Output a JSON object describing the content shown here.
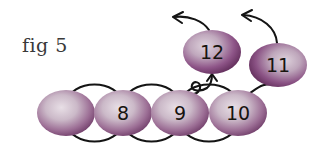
{
  "figure": {
    "caption": "fig 5",
    "caption_x": 22,
    "caption_y": 52,
    "background_color": "#ffffff",
    "width": 330,
    "height": 150
  },
  "palette": {
    "node_edge_dark": "#5f2a58",
    "node_mid": "#8e5f88",
    "node_light": "#d9ccd7",
    "node_highlight": "#e8dfe6",
    "stroke_black": "#141414",
    "caption_color": "#3a3a3a",
    "label_color": "#17140f"
  },
  "nodes": [
    {
      "id": "blank",
      "label": "",
      "cx": 66,
      "cy": 113,
      "rx": 29,
      "ry": 23,
      "row": "bottom"
    },
    {
      "id": "n8",
      "label": "8",
      "cx": 123,
      "cy": 113,
      "rx": 29,
      "ry": 23,
      "row": "bottom"
    },
    {
      "id": "n9",
      "label": "9",
      "cx": 180,
      "cy": 113,
      "rx": 29,
      "ry": 23,
      "row": "bottom"
    },
    {
      "id": "n10",
      "label": "10",
      "cx": 238,
      "cy": 113,
      "rx": 29,
      "ry": 23,
      "row": "bottom"
    },
    {
      "id": "n12",
      "label": "12",
      "cx": 212,
      "cy": 52,
      "rx": 29,
      "ry": 22,
      "row": "top"
    },
    {
      "id": "n11",
      "label": "11",
      "cx": 278,
      "cy": 65,
      "rx": 29,
      "ry": 22,
      "row": "top"
    }
  ],
  "edges": [
    {
      "id": "arc-blank-8-top",
      "from": "blank",
      "to": "n8",
      "style": "arc-above",
      "directed": false
    },
    {
      "id": "arc-blank-8-bot",
      "from": "blank",
      "to": "n8",
      "style": "arc-below",
      "directed": false
    },
    {
      "id": "arc-8-9-top",
      "from": "n8",
      "to": "n9",
      "style": "arc-above",
      "directed": false
    },
    {
      "id": "arc-8-9-bot",
      "from": "n8",
      "to": "n9",
      "style": "arc-below",
      "directed": false
    },
    {
      "id": "arc-9-10-top",
      "from": "n9",
      "to": "n10",
      "style": "arc-above",
      "directed": false
    },
    {
      "id": "arc-9-10-bot",
      "from": "n9",
      "to": "n10",
      "style": "arc-below",
      "directed": false
    },
    {
      "id": "curl-9-to-12",
      "from": "n9",
      "to": "n12",
      "style": "curl-loop",
      "directed": true
    },
    {
      "id": "arc-10-to-11",
      "from": "n10",
      "to": "n11",
      "style": "arc-right",
      "directed": false
    },
    {
      "id": "arrow-12-out",
      "from": "n12",
      "to": "",
      "style": "arrow-up-left",
      "directed": true
    },
    {
      "id": "arrow-11-out",
      "from": "n11",
      "to": "",
      "style": "arrow-up-left",
      "directed": true
    }
  ]
}
